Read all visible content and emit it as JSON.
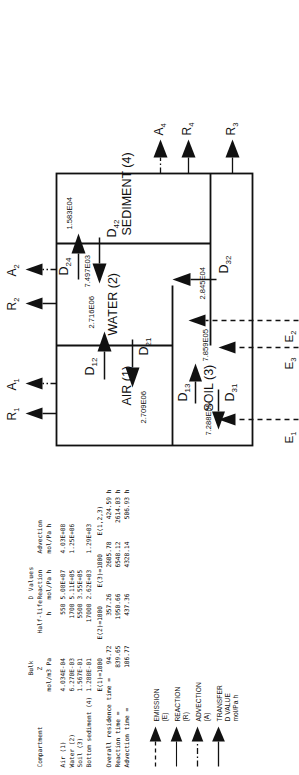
{
  "table": {
    "title_dvalues": "D Values",
    "headers": {
      "compartment": "Compartment",
      "bulk_z_l1": "Bulk",
      "bulk_z_l2": "Z",
      "bulk_z_l3": "mol/m3 Pa",
      "halflife_l1": "Half-life",
      "halflife_l2": "h",
      "reaction_l1": "Reaction",
      "reaction_l2": "mol/Pa h",
      "advection_l1": "Advection",
      "advection_l2": "mol/Pa h"
    },
    "rows": [
      {
        "compartment": "Air (1)",
        "bulk_z": "4.034E-04",
        "halflife": "550",
        "reaction": "5.08E+07",
        "advection": "4.03E+08"
      },
      {
        "compartment": "Water (2)",
        "bulk_z": "6.270E-03",
        "halflife": "1700",
        "reaction": "5.11E+05",
        "advection": "1.25E+06"
      },
      {
        "compartment": "Soil (3)",
        "bulk_z": "1.567E-01",
        "halflife": "5500",
        "reaction": "3.55E+05",
        "advection": ""
      },
      {
        "compartment": "Bottom sediment (4)",
        "bulk_z": "1.288E-01",
        "halflife": "17000",
        "reaction": "2.62E+03",
        "advection": "1.29E+03"
      }
    ]
  },
  "residence": {
    "col_headers": [
      "E(1)=1000",
      "E(2)=1000",
      "E(3)=1000",
      "E(1,2,3)"
    ],
    "rows": [
      {
        "label": "Overall residence time =",
        "values": [
          "94.72",
          "357.26",
          "2605.78",
          "424.59 h"
        ]
      },
      {
        "label": "Reaction time =",
        "values": [
          "839.65",
          "1950.66",
          "6548.12",
          "2614.03 h"
        ]
      },
      {
        "label": "Advection time =",
        "values": [
          "106.77",
          "437.36",
          "4328.14",
          "506.93 h"
        ]
      }
    ]
  },
  "legend": {
    "items": [
      {
        "name": "emission",
        "label": "EMISSION (E)",
        "style": "dashed"
      },
      {
        "name": "reaction",
        "label": "REACTION (R)",
        "style": "solid-thin"
      },
      {
        "name": "advection",
        "label": "ADVECTION (A)",
        "style": "dash-dot"
      },
      {
        "name": "transfer",
        "label": "TRANSFER D VALUE mol/Pa h",
        "style": "solid"
      }
    ]
  },
  "diagram": {
    "compartments": [
      {
        "id": "air",
        "label": "AIR (1)"
      },
      {
        "id": "water",
        "label": "WATER (2)"
      },
      {
        "id": "soil",
        "label": "SOIL (3)"
      },
      {
        "id": "sediment",
        "label": "SEDIMENT (4)"
      }
    ],
    "emissions": [
      {
        "id": "E1",
        "label": "E",
        "sub": "1"
      },
      {
        "id": "E2",
        "label": "E",
        "sub": "2"
      },
      {
        "id": "E3",
        "label": "E",
        "sub": "3"
      }
    ],
    "reactions": [
      {
        "id": "R1",
        "label": "R",
        "sub": "1"
      },
      {
        "id": "R2",
        "label": "R",
        "sub": "2"
      },
      {
        "id": "R3",
        "label": "R",
        "sub": "3"
      },
      {
        "id": "R4",
        "label": "R",
        "sub": "4"
      }
    ],
    "advections": [
      {
        "id": "A1",
        "label": "A",
        "sub": "1"
      },
      {
        "id": "A2",
        "label": "A",
        "sub": "2"
      },
      {
        "id": "A4",
        "label": "A",
        "sub": "4"
      }
    ],
    "transfers": [
      {
        "id": "D12",
        "label": "D",
        "sub": "12",
        "value": "2.716E06"
      },
      {
        "id": "D21",
        "label": "D",
        "sub": "21",
        "value": "2.709E06"
      },
      {
        "id": "D13",
        "label": "D",
        "sub": "13",
        "value": "7.859E05"
      },
      {
        "id": "D31",
        "label": "D",
        "sub": "31",
        "value": "7.288E05"
      },
      {
        "id": "D32",
        "label": "D",
        "sub": "32",
        "value": "2.845E04"
      },
      {
        "id": "D24",
        "label": "D",
        "sub": "24",
        "value": "1.583E04"
      },
      {
        "id": "D42",
        "label": "D",
        "sub": "42",
        "value": "7.497E03"
      }
    ]
  },
  "colors": {
    "ink": "#111111",
    "paper": "#ffffff"
  }
}
